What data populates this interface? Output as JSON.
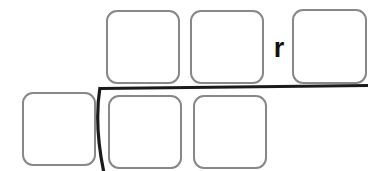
{
  "worksheet": {
    "type": "long-division-template",
    "title": "Long division answer frame",
    "remainder_marker": "r",
    "quotient_boxes": [
      {
        "name": "quotient-digit-1",
        "value": ""
      },
      {
        "name": "quotient-digit-2",
        "value": ""
      }
    ],
    "remainder_boxes": [
      {
        "name": "remainder-digit-1",
        "value": ""
      }
    ],
    "divisor_boxes": [
      {
        "name": "divisor-digit-1",
        "value": ""
      }
    ],
    "dividend_boxes": [
      {
        "name": "dividend-digit-1",
        "value": ""
      },
      {
        "name": "dividend-digit-2",
        "value": ""
      }
    ],
    "colors": {
      "background": "#ffffff",
      "box_border": "#888888",
      "division_rule": "#1a1a1a",
      "text": "#111111"
    }
  }
}
